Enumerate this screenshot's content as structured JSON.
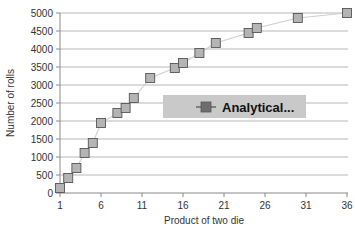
{
  "chart_data": {
    "type": "line",
    "title": "",
    "xlabel": "Product of two die",
    "ylabel": "Number of rolls",
    "xlim": [
      1,
      36
    ],
    "ylim": [
      0,
      5000
    ],
    "xticks": [
      1,
      6,
      11,
      16,
      21,
      26,
      31,
      36
    ],
    "yticks": [
      0,
      500,
      1000,
      1500,
      2000,
      2500,
      3000,
      3500,
      4000,
      4500,
      5000
    ],
    "grid": "horizontal",
    "legend_position": "center",
    "series": [
      {
        "name": "Analytical...",
        "marker": "square",
        "x": [
          1,
          2,
          3,
          4,
          5,
          6,
          8,
          9,
          10,
          12,
          15,
          16,
          18,
          20,
          24,
          25,
          30,
          36
        ],
        "values": [
          139,
          417,
          694,
          1111,
          1389,
          1944,
          2222,
          2361,
          2639,
          3194,
          3472,
          3611,
          3889,
          4167,
          4444,
          4583,
          4861,
          5000
        ]
      }
    ]
  },
  "axes": {
    "ytick_labels": [
      "5000",
      "4500",
      "4000",
      "3500",
      "3000",
      "2500",
      "2000",
      "1500",
      "1000",
      "500",
      "0"
    ],
    "xtick_labels": [
      "1",
      "6",
      "11",
      "16",
      "21",
      "26",
      "31",
      "36"
    ],
    "x_axis_title": "Product of two die",
    "y_axis_title": "Number of rolls"
  },
  "legend": {
    "entries": [
      {
        "label": "Analytical...",
        "marker_color": "#6e6e6e",
        "line_color": "#6e6e6e"
      }
    ],
    "background_color": "#c9c9c9"
  },
  "colors": {
    "background": "#ffffff",
    "gridline": "#9a9a9a",
    "axis": "#888888",
    "series_line": "#cfcfcf",
    "marker_fill": "#b4b4b4",
    "marker_stroke": "#555555",
    "text": "#333333"
  }
}
